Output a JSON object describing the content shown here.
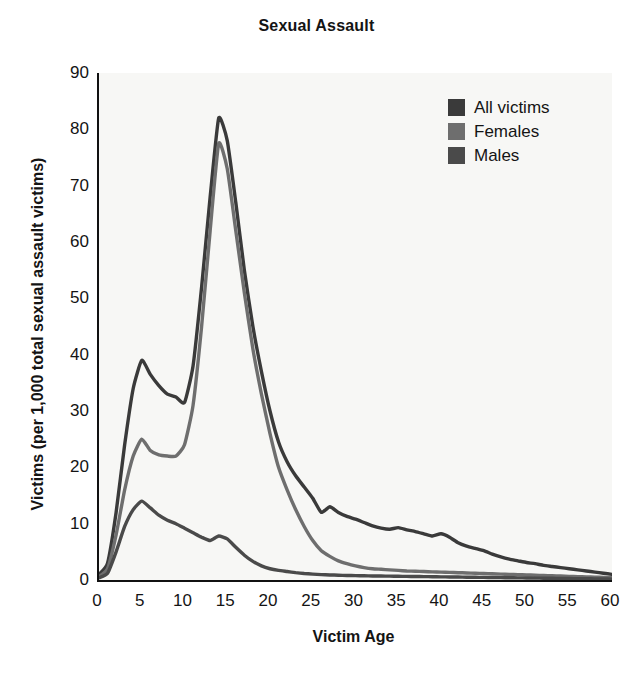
{
  "chart_data": {
    "type": "line",
    "title": "Sexual Assault",
    "xlabel": "Victim Age",
    "ylabel": "Victims (per 1,000 total sexual assault victims)",
    "xlim": [
      0,
      60
    ],
    "ylim": [
      0,
      90
    ],
    "xticks": [
      0,
      5,
      10,
      15,
      20,
      25,
      30,
      35,
      40,
      45,
      50,
      55,
      60
    ],
    "yticks": [
      0,
      10,
      20,
      30,
      40,
      50,
      60,
      70,
      80,
      90
    ],
    "grid": false,
    "legend_position": "top-right",
    "plot_background": "#f7f7f5",
    "x": [
      0,
      1,
      2,
      3,
      4,
      5,
      6,
      7,
      8,
      9,
      10,
      11,
      12,
      13,
      14,
      15,
      16,
      17,
      18,
      19,
      20,
      21,
      22,
      23,
      24,
      25,
      26,
      27,
      28,
      29,
      30,
      31,
      32,
      33,
      34,
      35,
      36,
      37,
      38,
      39,
      40,
      41,
      42,
      43,
      44,
      45,
      46,
      47,
      48,
      49,
      50,
      51,
      52,
      53,
      54,
      55,
      56,
      57,
      58,
      59,
      60
    ],
    "series": [
      {
        "name": "All victims",
        "color": "#3a3a3a",
        "values": [
          1.0,
          3.0,
          12.0,
          24.0,
          34.0,
          39.0,
          36.5,
          34.5,
          33.0,
          32.5,
          31.5,
          38.0,
          52.0,
          68.0,
          82.0,
          78.0,
          67.0,
          55.0,
          45.0,
          37.0,
          30.0,
          24.5,
          21.0,
          18.5,
          16.5,
          14.5,
          12.0,
          13.0,
          12.0,
          11.3,
          10.8,
          10.2,
          9.6,
          9.2,
          9.0,
          9.3,
          8.9,
          8.6,
          8.2,
          7.8,
          8.2,
          7.6,
          6.6,
          6.0,
          5.6,
          5.2,
          4.6,
          4.1,
          3.7,
          3.4,
          3.1,
          2.9,
          2.6,
          2.4,
          2.2,
          2.0,
          1.8,
          1.6,
          1.4,
          1.2,
          1.0
        ]
      },
      {
        "name": "Females",
        "color": "#6e6e6e",
        "values": [
          0.6,
          2.0,
          8.0,
          16.0,
          22.0,
          25.0,
          23.0,
          22.2,
          22.0,
          22.0,
          24.0,
          31.0,
          45.0,
          62.0,
          77.5,
          73.0,
          62.0,
          51.0,
          41.0,
          33.0,
          26.0,
          20.0,
          16.0,
          12.5,
          9.5,
          7.0,
          5.2,
          4.2,
          3.4,
          2.9,
          2.5,
          2.2,
          2.0,
          1.9,
          1.8,
          1.7,
          1.6,
          1.55,
          1.5,
          1.45,
          1.4,
          1.35,
          1.3,
          1.25,
          1.2,
          1.15,
          1.1,
          1.05,
          1.0,
          0.95,
          0.9,
          0.85,
          0.8,
          0.75,
          0.7,
          0.65,
          0.6,
          0.55,
          0.5,
          0.45,
          0.4
        ]
      },
      {
        "name": "Males",
        "color": "#4a4a4a",
        "values": [
          0.4,
          1.2,
          5.0,
          9.5,
          12.5,
          14.0,
          12.8,
          11.5,
          10.6,
          10.0,
          9.2,
          8.4,
          7.6,
          7.0,
          7.8,
          7.3,
          5.8,
          4.4,
          3.3,
          2.5,
          2.0,
          1.7,
          1.5,
          1.3,
          1.15,
          1.05,
          0.95,
          0.9,
          0.85,
          0.8,
          0.78,
          0.75,
          0.72,
          0.7,
          0.68,
          0.66,
          0.64,
          0.62,
          0.6,
          0.58,
          0.56,
          0.54,
          0.52,
          0.5,
          0.48,
          0.46,
          0.44,
          0.42,
          0.4,
          0.38,
          0.36,
          0.34,
          0.32,
          0.3,
          0.28,
          0.26,
          0.24,
          0.22,
          0.2,
          0.18,
          0.16
        ]
      }
    ],
    "legend": [
      {
        "label": "All victims",
        "color": "#3a3a3a"
      },
      {
        "label": "Females",
        "color": "#6e6e6e"
      },
      {
        "label": "Males",
        "color": "#4a4a4a"
      }
    ]
  }
}
